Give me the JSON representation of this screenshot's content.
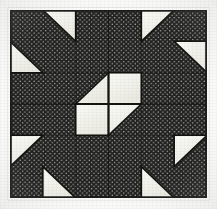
{
  "figure": {
    "kind": "quilt-block-diagram",
    "orientation": "square",
    "has_labels": false,
    "has_axes": false,
    "has_legend": false,
    "background_color": "#fbfbfa"
  },
  "block": {
    "name": "pieced-quilt-block",
    "grid_columns": 6,
    "grid_rows": 6,
    "cell_size_px": 32.5,
    "left_px": 10,
    "top_px": 10,
    "width_px": 197,
    "height_px": 188,
    "border_color": "#2a2a28",
    "border_width_px": 1.5
  },
  "colors": {
    "dark_fabric": "#232322",
    "dark_fabric_dot": "#c9c9c4",
    "light_fabric": "#f7f7f3",
    "light_fabric_shade": "#e6e6df",
    "seam_line": "#111110",
    "outline": "#1b1b1a",
    "paper": "#fbfbfa"
  },
  "patch_groups": [
    {
      "id": "corner-unit-top-left",
      "label": "Top-left corner unit",
      "light_triangles": 2,
      "note": "Two half-square triangles stepped along the anti-diagonal, light fabric points toward block center."
    },
    {
      "id": "corner-unit-top-right",
      "label": "Top-right corner unit",
      "light_triangles": 2,
      "note": "Mirror of top-left unit across the vertical centerline."
    },
    {
      "id": "corner-unit-bottom-left",
      "label": "Bottom-left corner unit",
      "light_triangles": 2,
      "note": "Mirror of top-left unit across the horizontal centerline."
    },
    {
      "id": "corner-unit-bottom-right",
      "label": "Bottom-right corner unit",
      "light_triangles": 2,
      "note": "Rotation of top-left unit by 180 degrees."
    },
    {
      "id": "center-four-patch",
      "label": "Center four-patch",
      "light_triangles": 2,
      "light_squares": 2,
      "note": "Two light squares on the anti-diagonal plus two light triangles whose outer corners are cut away by the dark ground."
    }
  ],
  "center_unit": {
    "grid_origin_col": 2,
    "grid_origin_row": 2,
    "span_cols": 2,
    "span_rows": 2,
    "cells": [
      {
        "id": "center-cell-top-left",
        "shape": "triangle",
        "fill": "light",
        "hypotenuse": "lower-left-to-upper-right"
      },
      {
        "id": "center-cell-top-right",
        "shape": "square",
        "fill": "light",
        "hypotenuse": "none"
      },
      {
        "id": "center-cell-bottom-left",
        "shape": "square",
        "fill": "light",
        "hypotenuse": "none"
      },
      {
        "id": "center-cell-bottom-right",
        "shape": "triangle",
        "fill": "light",
        "hypotenuse": "lower-left-to-upper-right"
      }
    ]
  },
  "geometry": {
    "note": "Coordinates below are in a 6x6 unit grid, origin at block top-left, one unit = one grid cell.",
    "light_patches": [
      {
        "id": "tl-tri-outer",
        "group": "corner-unit-top-left",
        "points": "1,0 2,0 2,1"
      },
      {
        "id": "tl-tri-inner",
        "group": "corner-unit-top-left",
        "points": "0,1 1,2 0,2"
      },
      {
        "id": "tr-tri-outer",
        "group": "corner-unit-top-right",
        "points": "4,0 5,0 4,1"
      },
      {
        "id": "tr-tri-inner",
        "group": "corner-unit-top-right",
        "points": "5,1 6,1 6,2"
      },
      {
        "id": "bl-tri-inner",
        "group": "corner-unit-bottom-left",
        "points": "0,4 1,4 0,5"
      },
      {
        "id": "bl-tri-outer",
        "group": "corner-unit-bottom-left",
        "points": "1,5 2,6 1,6"
      },
      {
        "id": "br-tri-inner",
        "group": "corner-unit-bottom-right",
        "points": "5,4 6,4 5,5"
      },
      {
        "id": "br-tri-outer",
        "group": "corner-unit-bottom-right",
        "points": "4,6 4,5 5,6"
      },
      {
        "id": "c-tri-tl",
        "group": "center-four-patch",
        "points": "2,3 3,2 3,3"
      },
      {
        "id": "c-sq-tr",
        "group": "center-four-patch",
        "points": "3,2 4,2 4,3 3,3"
      },
      {
        "id": "c-sq-bl",
        "group": "center-four-patch",
        "points": "2,3 3,3 3,4 2,4"
      },
      {
        "id": "c-tri-br",
        "group": "center-four-patch",
        "points": "3,3 4,3 3,4"
      }
    ],
    "seam_lines": [
      {
        "id": "seam-vertical-center",
        "from": "3,0",
        "to": "3,6"
      },
      {
        "id": "seam-horizontal-center",
        "from": "0,3",
        "to": "6,3"
      },
      {
        "id": "seam-vertical-left",
        "from": "2,2",
        "to": "2,4"
      },
      {
        "id": "seam-vertical-right",
        "from": "4,2",
        "to": "4,4"
      },
      {
        "id": "seam-horizontal-upper",
        "from": "2,2",
        "to": "4,2"
      },
      {
        "id": "seam-horizontal-lower",
        "from": "2,4",
        "to": "4,4"
      }
    ]
  }
}
